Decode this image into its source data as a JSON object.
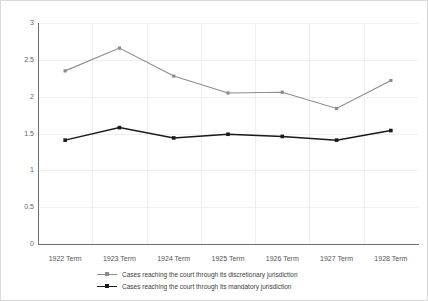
{
  "chart_data": {
    "type": "line",
    "title": "",
    "subtitle": "",
    "xlabel": "",
    "ylabel": "",
    "categories": [
      "1922 Term",
      "1923 Term",
      "1924 Term",
      "1925 Term",
      "1926 Term",
      "1927 Term",
      "1928 Term"
    ],
    "ylim": [
      0,
      3
    ],
    "yticks": [
      0,
      0.5,
      1,
      1.5,
      2,
      2.5,
      3
    ],
    "ytick_labels": [
      "0",
      "0.5",
      "1",
      "1.5",
      "2",
      "2.5",
      "3"
    ],
    "grid": true,
    "legend_position": "bottom",
    "series": [
      {
        "name": "Cases reaching the court through its discretionary jurisdiction",
        "color": "#8c8c8c",
        "marker": "square",
        "values": [
          2.35,
          2.66,
          2.28,
          2.05,
          2.06,
          1.84,
          2.22
        ]
      },
      {
        "name": "Cases reaching the court through its mandatory jurisdiction",
        "color": "#1a1a1a",
        "marker": "square",
        "values": [
          1.41,
          1.58,
          1.44,
          1.49,
          1.46,
          1.41,
          1.54
        ]
      }
    ],
    "annotations": []
  },
  "colors": {
    "background": "#ffffff",
    "border": "#d9d9d9",
    "axis": "#6e6e6e",
    "grid": "#efefef",
    "tick_text": "#666666",
    "legend_text": "#3c3c3c",
    "series_discretionary": "#8c8c8c",
    "series_mandatory": "#1a1a1a"
  }
}
